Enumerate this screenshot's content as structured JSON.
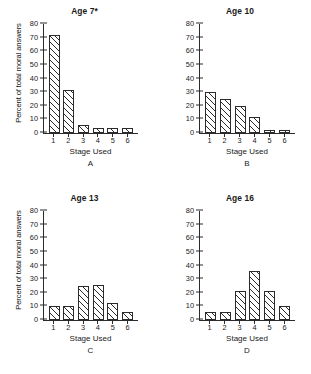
{
  "figure": {
    "axis_title_x": "Stage Used",
    "axis_title_y": "Percent of total moral answers"
  },
  "chart_data": [
    {
      "type": "bar",
      "panel": "A",
      "title": "Age 7*",
      "categories": [
        "1",
        "2",
        "3",
        "4",
        "5",
        "6"
      ],
      "values": [
        71,
        31,
        6,
        4,
        4,
        4
      ],
      "xlabel": "Stage Used",
      "ylabel": "Percent of total moral answers",
      "ylim": [
        0,
        80
      ],
      "yticks": [
        0,
        10,
        20,
        30,
        40,
        50,
        60,
        70,
        80
      ],
      "grid": false,
      "legend": "none"
    },
    {
      "type": "bar",
      "panel": "B",
      "title": "Age 10",
      "categories": [
        "1",
        "2",
        "3",
        "4",
        "5",
        "6"
      ],
      "values": [
        30,
        25,
        20,
        12,
        2,
        2
      ],
      "xlabel": "Stage Used",
      "ylabel": "",
      "ylim": [
        0,
        80
      ],
      "yticks": [
        0,
        10,
        20,
        30,
        40,
        50,
        60,
        70,
        80
      ],
      "grid": false,
      "legend": "none"
    },
    {
      "type": "bar",
      "panel": "C",
      "title": "Age 13",
      "categories": [
        "1",
        "2",
        "3",
        "4",
        "5",
        "6"
      ],
      "values": [
        10.5,
        10.5,
        25,
        25.5,
        12.5,
        5.5
      ],
      "xlabel": "Stage Used",
      "ylabel": "Percent of total moral answers",
      "ylim": [
        0,
        80
      ],
      "yticks": [
        0,
        10,
        20,
        30,
        40,
        50,
        60,
        70,
        80
      ],
      "grid": false,
      "legend": "none"
    },
    {
      "type": "bar",
      "panel": "D",
      "title": "Age 16",
      "categories": [
        "1",
        "2",
        "3",
        "4",
        "5",
        "6"
      ],
      "values": [
        6,
        6,
        21,
        36,
        21,
        10.5
      ],
      "xlabel": "Stage Used",
      "ylabel": "",
      "ylim": [
        0,
        80
      ],
      "yticks": [
        0,
        10,
        20,
        30,
        40,
        50,
        60,
        70,
        80
      ],
      "grid": false,
      "legend": "none"
    }
  ]
}
